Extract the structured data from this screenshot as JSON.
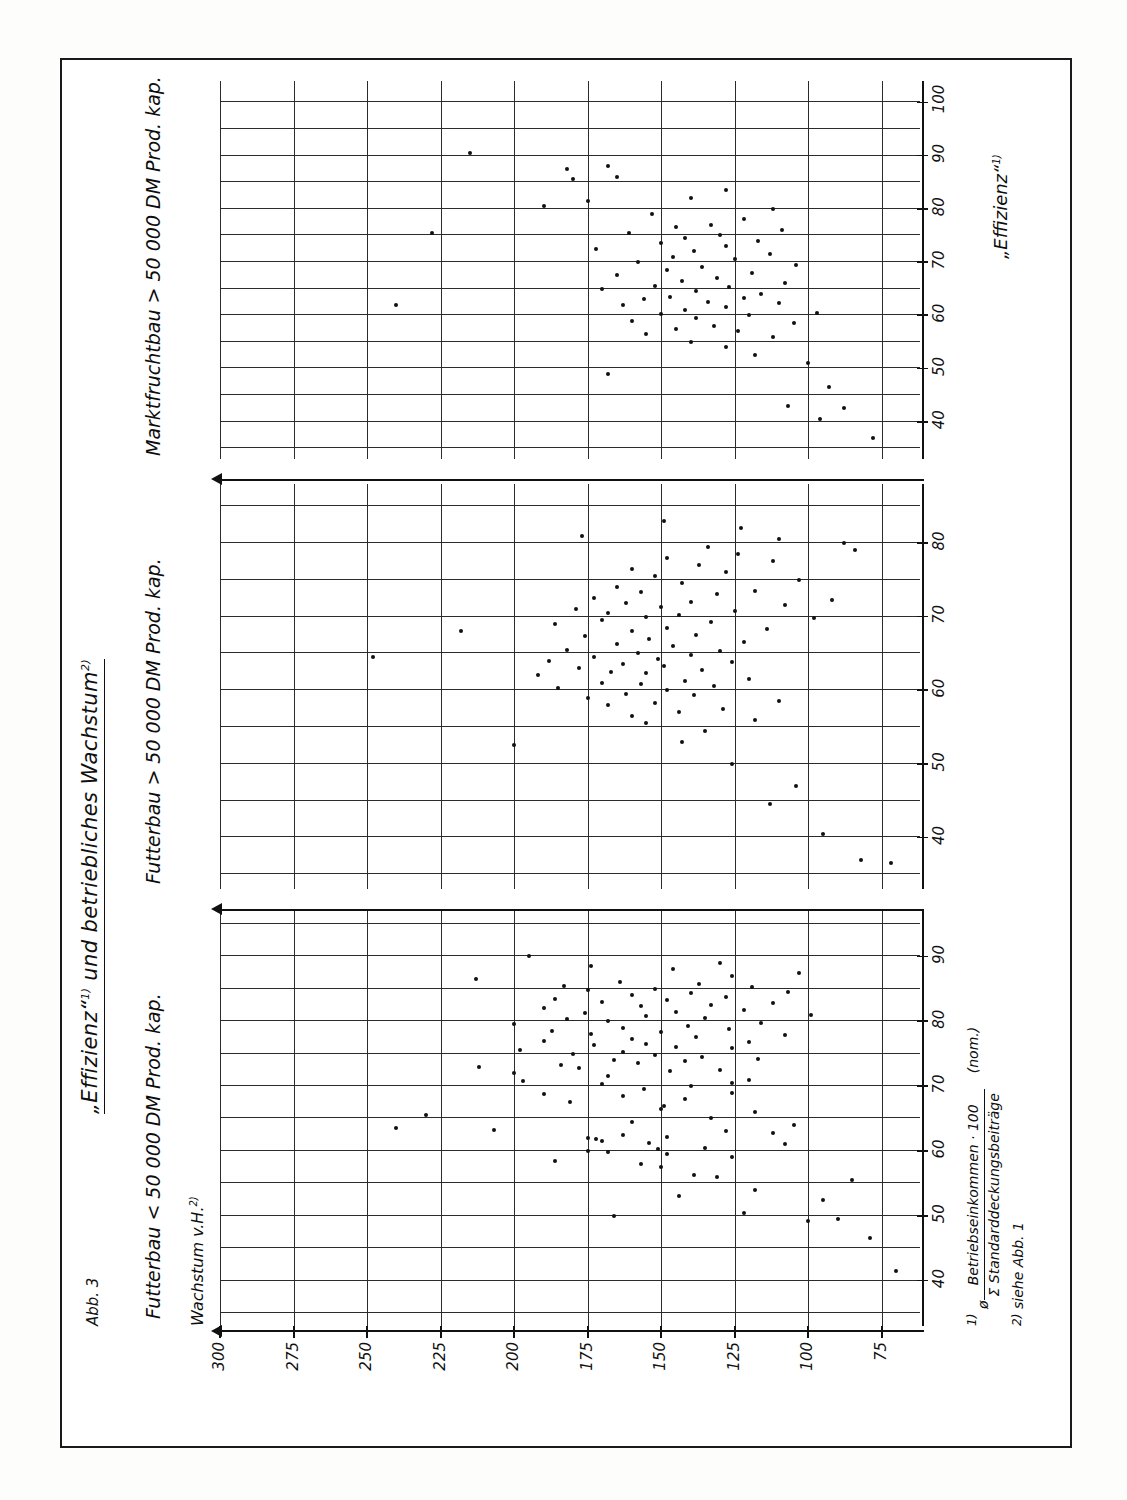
{
  "figure": {
    "number_label": "Abb. 3",
    "title_part1": "„Effizienz“",
    "title_sup1": "1)",
    "title_part2": " und  betriebliches  Wachstum",
    "title_sup2": "2)"
  },
  "axes": {
    "y_axis_title": "Wachstum v.H.",
    "y_axis_title_sup": "2)",
    "y_ticks": [
      300,
      275,
      250,
      225,
      200,
      175,
      150,
      125,
      100,
      75
    ],
    "x_axis_title": "„Effizienz“",
    "x_axis_title_sup": "1)"
  },
  "footnotes": [
    {
      "mark": "1)",
      "symbol": "ø ",
      "numerator": "Betriebseinkommen · 100",
      "denominator": "Σ Standarddeckungsbeiträge",
      "suffix": "(nom.)"
    },
    {
      "mark": "2)",
      "text": "siehe Abb. 1"
    }
  ],
  "chart_data": {
    "type": "scatter",
    "title": "„Effizienz“1) und betriebliches Wachstum2)",
    "xlabel": "„Effizienz“1)",
    "ylabel": "Wachstum v.H.2)",
    "ylim": [
      62,
      300
    ],
    "yticks": [
      75,
      100,
      125,
      150,
      175,
      200,
      225,
      250,
      275,
      300
    ],
    "grid": true,
    "legend": "none",
    "panels": [
      {
        "label": "Futterbau < 50 000 DM Prod. kap.",
        "xlim": [
          33,
          97
        ],
        "xticks": [
          40,
          50,
          60,
          70,
          80,
          90
        ],
        "points": [
          [
            41.5,
            70
          ],
          [
            46.5,
            79
          ],
          [
            49.5,
            90
          ],
          [
            49.2,
            100
          ],
          [
            50.5,
            122
          ],
          [
            52.5,
            95
          ],
          [
            53.0,
            144
          ],
          [
            54.0,
            118
          ],
          [
            50.0,
            166
          ],
          [
            55.5,
            85
          ],
          [
            56.0,
            131
          ],
          [
            56.3,
            139
          ],
          [
            57.5,
            150
          ],
          [
            58.0,
            157
          ],
          [
            58.5,
            186
          ],
          [
            59.0,
            126
          ],
          [
            59.5,
            148
          ],
          [
            59.8,
            168
          ],
          [
            60.0,
            175
          ],
          [
            60.3,
            151
          ],
          [
            60.5,
            135
          ],
          [
            61.0,
            108
          ],
          [
            61.2,
            154
          ],
          [
            61.5,
            170
          ],
          [
            61.8,
            172
          ],
          [
            62.0,
            175
          ],
          [
            62.2,
            148
          ],
          [
            62.5,
            163
          ],
          [
            62.8,
            112
          ],
          [
            63.0,
            128
          ],
          [
            63.3,
            207
          ],
          [
            63.5,
            240
          ],
          [
            64.0,
            105
          ],
          [
            64.5,
            160
          ],
          [
            65.0,
            133
          ],
          [
            65.5,
            230
          ],
          [
            66.0,
            118
          ],
          [
            66.5,
            150
          ],
          [
            67.0,
            149
          ],
          [
            67.5,
            181
          ],
          [
            68.0,
            142
          ],
          [
            68.5,
            163
          ],
          [
            68.8,
            190
          ],
          [
            69.0,
            126
          ],
          [
            69.5,
            156
          ],
          [
            70.0,
            140
          ],
          [
            70.3,
            170
          ],
          [
            70.5,
            126
          ],
          [
            70.8,
            197
          ],
          [
            71.0,
            120
          ],
          [
            71.5,
            168
          ],
          [
            72.0,
            200
          ],
          [
            72.3,
            147
          ],
          [
            72.5,
            130
          ],
          [
            72.8,
            178
          ],
          [
            73.0,
            212
          ],
          [
            73.2,
            184
          ],
          [
            73.5,
            158
          ],
          [
            73.8,
            142
          ],
          [
            74.0,
            166
          ],
          [
            74.2,
            117
          ],
          [
            74.5,
            136
          ],
          [
            74.8,
            152
          ],
          [
            75.0,
            180
          ],
          [
            75.3,
            163
          ],
          [
            75.5,
            198
          ],
          [
            75.8,
            126
          ],
          [
            76.0,
            145
          ],
          [
            76.3,
            173
          ],
          [
            76.5,
            155
          ],
          [
            76.8,
            120
          ],
          [
            77.0,
            190
          ],
          [
            77.3,
            160
          ],
          [
            77.5,
            138
          ],
          [
            77.8,
            108
          ],
          [
            78.0,
            174
          ],
          [
            78.3,
            150
          ],
          [
            78.5,
            187
          ],
          [
            78.8,
            127
          ],
          [
            79.0,
            163
          ],
          [
            79.3,
            141
          ],
          [
            79.5,
            200
          ],
          [
            79.8,
            116
          ],
          [
            80.0,
            168
          ],
          [
            80.3,
            182
          ],
          [
            80.5,
            135
          ],
          [
            80.8,
            155
          ],
          [
            81.0,
            99
          ],
          [
            81.3,
            176
          ],
          [
            81.5,
            145
          ],
          [
            81.8,
            122
          ],
          [
            82.0,
            190
          ],
          [
            82.3,
            157
          ],
          [
            82.5,
            133
          ],
          [
            82.8,
            112
          ],
          [
            83.0,
            170
          ],
          [
            83.3,
            148
          ],
          [
            83.5,
            186
          ],
          [
            83.8,
            128
          ],
          [
            84.0,
            160
          ],
          [
            84.3,
            140
          ],
          [
            84.5,
            107
          ],
          [
            84.8,
            175
          ],
          [
            85.0,
            152
          ],
          [
            85.3,
            119
          ],
          [
            85.5,
            183
          ],
          [
            85.8,
            137
          ],
          [
            86.0,
            164
          ],
          [
            86.5,
            213
          ],
          [
            87.0,
            126
          ],
          [
            87.5,
            103
          ],
          [
            88.0,
            146
          ],
          [
            88.5,
            174
          ],
          [
            89.0,
            130
          ],
          [
            90.0,
            195
          ]
        ]
      },
      {
        "label": "Futterbau > 50 000 DM Prod. kap.",
        "xlim": [
          33,
          88
        ],
        "xticks": [
          40,
          50,
          60,
          70,
          80
        ],
        "points": [
          [
            36.5,
            72
          ],
          [
            37.0,
            82
          ],
          [
            40.5,
            95
          ],
          [
            44.5,
            113
          ],
          [
            47.0,
            104
          ],
          [
            50.0,
            126
          ],
          [
            52.5,
            200
          ],
          [
            53.0,
            143
          ],
          [
            54.5,
            135
          ],
          [
            55.5,
            155
          ],
          [
            56.0,
            118
          ],
          [
            56.5,
            160
          ],
          [
            57.0,
            144
          ],
          [
            57.5,
            129
          ],
          [
            58.0,
            168
          ],
          [
            58.3,
            152
          ],
          [
            58.5,
            110
          ],
          [
            59.0,
            175
          ],
          [
            59.3,
            139
          ],
          [
            59.5,
            162
          ],
          [
            60.0,
            148
          ],
          [
            60.3,
            185
          ],
          [
            60.5,
            132
          ],
          [
            60.8,
            157
          ],
          [
            61.0,
            170
          ],
          [
            61.3,
            142
          ],
          [
            61.5,
            120
          ],
          [
            62.0,
            192
          ],
          [
            62.3,
            155
          ],
          [
            62.5,
            167
          ],
          [
            62.8,
            136
          ],
          [
            63.0,
            178
          ],
          [
            63.3,
            149
          ],
          [
            63.5,
            163
          ],
          [
            63.8,
            126
          ],
          [
            64.0,
            188
          ],
          [
            64.3,
            151
          ],
          [
            64.5,
            173
          ],
          [
            64.8,
            140
          ],
          [
            65.0,
            158
          ],
          [
            65.3,
            130
          ],
          [
            65.5,
            182
          ],
          [
            66.0,
            146
          ],
          [
            66.3,
            165
          ],
          [
            66.5,
            122
          ],
          [
            67.0,
            154
          ],
          [
            67.3,
            176
          ],
          [
            67.5,
            138
          ],
          [
            68.0,
            160
          ],
          [
            68.3,
            114
          ],
          [
            68.5,
            148
          ],
          [
            69.0,
            186
          ],
          [
            69.2,
            133
          ],
          [
            69.5,
            170
          ],
          [
            69.8,
            98
          ],
          [
            70.0,
            155
          ],
          [
            70.2,
            144
          ],
          [
            70.5,
            168
          ],
          [
            70.8,
            125
          ],
          [
            71.0,
            179
          ],
          [
            71.3,
            150
          ],
          [
            71.5,
            108
          ],
          [
            71.8,
            162
          ],
          [
            72.0,
            140
          ],
          [
            72.3,
            92
          ],
          [
            72.5,
            173
          ],
          [
            73.0,
            131
          ],
          [
            73.3,
            157
          ],
          [
            73.5,
            118
          ],
          [
            74.0,
            165
          ],
          [
            74.5,
            143
          ],
          [
            75.0,
            103
          ],
          [
            75.5,
            152
          ],
          [
            76.0,
            128
          ],
          [
            76.5,
            160
          ],
          [
            77.0,
            137
          ],
          [
            77.5,
            112
          ],
          [
            78.0,
            148
          ],
          [
            78.5,
            124
          ],
          [
            79.0,
            84
          ],
          [
            79.5,
            134
          ],
          [
            80.0,
            88
          ],
          [
            80.5,
            110
          ],
          [
            81.0,
            177
          ],
          [
            82.0,
            123
          ],
          [
            83.0,
            149
          ],
          [
            64.5,
            248
          ],
          [
            68.0,
            218
          ]
        ]
      },
      {
        "label": "Marktfruchtbau > 50 000 DM Prod. kap.",
        "xlim": [
          33,
          104
        ],
        "xticks": [
          40,
          50,
          60,
          70,
          80,
          90,
          100
        ],
        "points": [
          [
            37.0,
            78
          ],
          [
            40.5,
            96
          ],
          [
            42.5,
            88
          ],
          [
            43.0,
            107
          ],
          [
            46.5,
            93
          ],
          [
            49.0,
            168
          ],
          [
            51.0,
            100
          ],
          [
            52.5,
            118
          ],
          [
            54.0,
            128
          ],
          [
            55.0,
            140
          ],
          [
            56.0,
            112
          ],
          [
            56.5,
            155
          ],
          [
            57.0,
            124
          ],
          [
            57.5,
            145
          ],
          [
            58.0,
            132
          ],
          [
            58.5,
            105
          ],
          [
            59.0,
            160
          ],
          [
            59.5,
            138
          ],
          [
            60.0,
            120
          ],
          [
            60.3,
            150
          ],
          [
            60.5,
            97
          ],
          [
            61.0,
            142
          ],
          [
            61.5,
            128
          ],
          [
            62.0,
            163
          ],
          [
            62.3,
            110
          ],
          [
            62.5,
            134
          ],
          [
            63.0,
            156
          ],
          [
            63.3,
            122
          ],
          [
            63.5,
            147
          ],
          [
            64.0,
            116
          ],
          [
            64.5,
            138
          ],
          [
            65.0,
            170
          ],
          [
            65.3,
            127
          ],
          [
            65.5,
            152
          ],
          [
            66.0,
            108
          ],
          [
            66.5,
            143
          ],
          [
            67.0,
            131
          ],
          [
            67.5,
            165
          ],
          [
            68.0,
            119
          ],
          [
            68.5,
            148
          ],
          [
            69.0,
            136
          ],
          [
            69.5,
            104
          ],
          [
            70.0,
            158
          ],
          [
            70.5,
            125
          ],
          [
            71.0,
            146
          ],
          [
            71.5,
            113
          ],
          [
            72.0,
            139
          ],
          [
            72.5,
            172
          ],
          [
            73.0,
            128
          ],
          [
            73.5,
            150
          ],
          [
            74.0,
            117
          ],
          [
            74.5,
            142
          ],
          [
            75.0,
            130
          ],
          [
            75.5,
            161
          ],
          [
            76.0,
            109
          ],
          [
            76.5,
            145
          ],
          [
            77.0,
            133
          ],
          [
            78.0,
            122
          ],
          [
            79.0,
            153
          ],
          [
            80.0,
            112
          ],
          [
            80.5,
            190
          ],
          [
            81.5,
            175
          ],
          [
            82.0,
            140
          ],
          [
            83.5,
            128
          ],
          [
            85.5,
            180
          ],
          [
            86.0,
            165
          ],
          [
            87.5,
            182
          ],
          [
            88.0,
            168
          ],
          [
            90.5,
            215
          ],
          [
            62.0,
            240
          ],
          [
            75.5,
            228
          ]
        ]
      }
    ]
  }
}
